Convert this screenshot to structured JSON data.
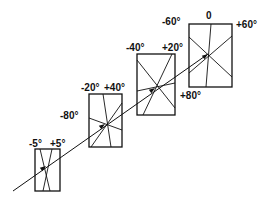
{
  "diagram": {
    "boxes": [
      {
        "id": "box-1",
        "rect": {
          "x": 35,
          "y": 149,
          "w": 25,
          "h": 42
        },
        "labels": [
          {
            "text": "-5°",
            "x": 29,
            "y": 147
          },
          {
            "text": "+5°",
            "x": 50,
            "y": 147
          }
        ],
        "lines": [
          {
            "x1": 40,
            "y1": 149,
            "x2": 50,
            "y2": 191
          },
          {
            "x1": 52,
            "y1": 149,
            "x2": 43,
            "y2": 191
          }
        ],
        "arrow": {
          "x": 46,
          "y": 166
        }
      },
      {
        "id": "box-2",
        "rect": {
          "x": 89,
          "y": 94,
          "w": 33,
          "h": 53
        },
        "labels": [
          {
            "text": "-20°",
            "x": 81,
            "y": 91
          },
          {
            "text": "+40°",
            "x": 104,
            "y": 91
          },
          {
            "text": "-80°",
            "x": 60,
            "y": 119
          }
        ],
        "lines": [
          {
            "x1": 103,
            "y1": 94,
            "x2": 111,
            "y2": 147
          },
          {
            "x1": 122,
            "y1": 103,
            "x2": 91,
            "y2": 147
          },
          {
            "x1": 89,
            "y1": 118,
            "x2": 122,
            "y2": 130
          }
        ],
        "arrow": {
          "x": 105,
          "y": 124
        }
      },
      {
        "id": "box-3",
        "rect": {
          "x": 137,
          "y": 54,
          "w": 38,
          "h": 61
        },
        "labels": [
          {
            "text": "-40°",
            "x": 126,
            "y": 51
          },
          {
            "text": "+20°",
            "x": 162,
            "y": 51
          },
          {
            "text": "+80°",
            "x": 180,
            "y": 99
          }
        ],
        "lines": [
          {
            "x1": 137,
            "y1": 60,
            "x2": 175,
            "y2": 108
          },
          {
            "x1": 172,
            "y1": 54,
            "x2": 143,
            "y2": 115
          },
          {
            "x1": 137,
            "y1": 91,
            "x2": 175,
            "y2": 83
          }
        ],
        "arrow": {
          "x": 155,
          "y": 88
        }
      },
      {
        "id": "box-4",
        "rect": {
          "x": 189,
          "y": 24,
          "w": 43,
          "h": 63
        },
        "labels": [
          {
            "text": "-60°",
            "x": 162,
            "y": 25
          },
          {
            "text": "0",
            "x": 206,
            "y": 19
          },
          {
            "text": "+60°",
            "x": 236,
            "y": 28
          }
        ],
        "lines": [
          {
            "x1": 211,
            "y1": 24,
            "x2": 206,
            "y2": 87
          },
          {
            "x1": 189,
            "y1": 37,
            "x2": 232,
            "y2": 77
          },
          {
            "x1": 232,
            "y1": 36,
            "x2": 189,
            "y2": 73
          }
        ],
        "arrow": {
          "x": 208,
          "y": 54
        }
      }
    ],
    "main_line": {
      "x1": 13,
      "y1": 191,
      "x2": 208,
      "y2": 54
    },
    "colors": {
      "stroke": "#111111",
      "background": "#ffffff"
    }
  }
}
